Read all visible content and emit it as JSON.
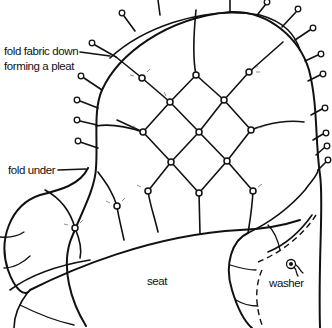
{
  "diagram": {
    "labels": {
      "fold_pleat_line1": "fold fabric down",
      "fold_pleat_line2": "forming a pleat",
      "fold_under": "fold under",
      "seat": "seat",
      "washer": "washer"
    },
    "colors": {
      "line": "#111111",
      "background": "#ffffff",
      "sparkle": "#777777"
    },
    "buttons": [
      {
        "x": 142,
        "y": 78
      },
      {
        "x": 196,
        "y": 75
      },
      {
        "x": 249,
        "y": 72
      },
      {
        "x": 170,
        "y": 102
      },
      {
        "x": 224,
        "y": 100
      },
      {
        "x": 143,
        "y": 132
      },
      {
        "x": 199,
        "y": 132
      },
      {
        "x": 251,
        "y": 130
      },
      {
        "x": 171,
        "y": 162
      },
      {
        "x": 227,
        "y": 161
      },
      {
        "x": 148,
        "y": 191
      },
      {
        "x": 199,
        "y": 193
      },
      {
        "x": 253,
        "y": 191
      },
      {
        "x": 75,
        "y": 228
      },
      {
        "x": 117,
        "y": 206
      }
    ]
  }
}
